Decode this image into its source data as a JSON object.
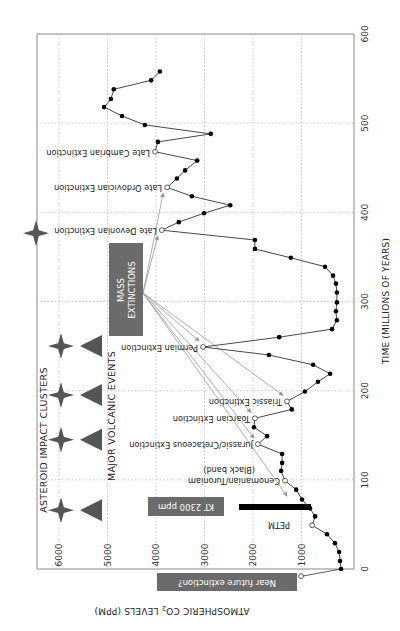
{
  "chart_data": {
    "type": "line",
    "title": "",
    "orientation": "rotated 90 degrees (time axis vertical, CO2 axis horizontal, reversed)",
    "xlabel": "TIME (MILLIONS OF YEARS)",
    "ylabel": "ATMOSPHERIC CO2 LEVELS (PPM)",
    "xlim": [
      0,
      600
    ],
    "ylim": [
      0,
      6500
    ],
    "x_ticks": [
      "0",
      "100",
      "200",
      "300",
      "400",
      "500",
      "600"
    ],
    "y_ticks": [
      "1000",
      "2000",
      "3000",
      "4000",
      "5000",
      "6000"
    ],
    "grid": true,
    "series": [
      {
        "name": "Atmospheric CO2",
        "points": [
          [
            0,
            185
          ],
          [
            9,
            205
          ],
          [
            19,
            225
          ],
          [
            29,
            310
          ],
          [
            39,
            475
          ],
          [
            49,
            780
          ],
          [
            59,
            720
          ],
          [
            68,
            825
          ],
          [
            78,
            990
          ],
          [
            89,
            1110
          ],
          [
            99,
            1340
          ],
          [
            110,
            1420
          ],
          [
            119,
            1400
          ],
          [
            129,
            1400
          ],
          [
            140,
            1900
          ],
          [
            149,
            1710
          ],
          [
            159,
            1980
          ],
          [
            169,
            1960
          ],
          [
            179,
            1200
          ],
          [
            188,
            1300
          ],
          [
            199,
            930
          ],
          [
            210,
            660
          ],
          [
            219,
            410
          ],
          [
            229,
            760
          ],
          [
            240,
            1670
          ],
          [
            249,
            3030
          ],
          [
            260,
            1460
          ],
          [
            269,
            370
          ],
          [
            279,
            270
          ],
          [
            289,
            290
          ],
          [
            299,
            270
          ],
          [
            310,
            270
          ],
          [
            320,
            290
          ],
          [
            329,
            350
          ],
          [
            339,
            515
          ],
          [
            349,
            1220
          ],
          [
            359,
            1960
          ],
          [
            369,
            1960
          ],
          [
            380,
            3880
          ],
          [
            389,
            3530
          ],
          [
            399,
            3010
          ],
          [
            408,
            2470
          ],
          [
            418,
            3260
          ],
          [
            428,
            3770
          ],
          [
            438,
            3570
          ],
          [
            447,
            3400
          ],
          [
            458,
            3150
          ],
          [
            468,
            4020
          ],
          [
            479,
            3960
          ],
          [
            488,
            2870
          ],
          [
            498,
            4230
          ],
          [
            508,
            4700
          ],
          [
            518,
            5070
          ],
          [
            527,
            4930
          ],
          [
            538,
            4870
          ],
          [
            548,
            4100
          ],
          [
            558,
            3920
          ]
        ]
      }
    ],
    "events": [
      {
        "name": "Near future extinction?",
        "time": -8,
        "co2": 1010
      },
      {
        "name": "PETM",
        "time": 49,
        "co2": 780
      },
      {
        "name": "Cenomanian/Turoniam (Black band)",
        "time": 99,
        "co2": 1340
      },
      {
        "name": "Jurassic/Cretaceous Extinction",
        "time": 140,
        "co2": 1900
      },
      {
        "name": "Toarcian Extinction",
        "time": 169,
        "co2": 1960
      },
      {
        "name": "Triassic Extinction",
        "time": 188,
        "co2": 1300
      },
      {
        "name": "Permian Extinction",
        "time": 249,
        "co2": 3030
      },
      {
        "name": "Late Devonian Extinction",
        "time": 380,
        "co2": 3880
      },
      {
        "name": "Late Ordovician Extinction",
        "time": 428,
        "co2": 3770
      },
      {
        "name": "Late Cambrian Extinction",
        "time": 468,
        "co2": 4020
      }
    ],
    "annotations": {
      "kt_bar": {
        "label": "KT 2300 ppm",
        "time": 68,
        "co2_from": 800,
        "co2_to": 2300
      },
      "mass_extinctions_label": "MASS EXTINCTIONS",
      "asteroid_impact_clusters": [
        66,
        145,
        195,
        250,
        380
      ],
      "major_volcanic_events": [
        66,
        145,
        195,
        250
      ]
    }
  },
  "labels": {
    "x_title": "TIME (MILLIONS OF YEARS)",
    "y_title_pre": "ATMOSPHERIC CO",
    "y_title_sub": "2",
    "y_title_post": " LEVELS (PPM)",
    "asteroid_title": "ASTEROID IMPACT CLUSTERS",
    "volcanic_title": "MAJOR VOLCANIC EVENTS",
    "mass_line1": "MASS",
    "mass_line2": "EXTINCTIONS",
    "kt_box": "KT 2300 ppm",
    "petm": "PETM",
    "near_future": "Near future extinction?",
    "cen_line1": "Cenomanian/Turoniam",
    "cen_line2": "(Black band)",
    "jk": "Jurassic/Cretaceous Extinction",
    "toarcian": "Toarcian Extinction",
    "triassic": "Triassic Extinction",
    "permian": "Permian Extinction",
    "devonian": "Late Devonian Extinction",
    "ordovician": "Late Ordovician Extinction",
    "cambrian": "Late Cambrian Extinction"
  },
  "colors": {
    "box_fill": "#6b6b6b",
    "marker": "#555555",
    "grid": "#bbbbbb",
    "line": "#333333",
    "arrow": "#999999"
  }
}
